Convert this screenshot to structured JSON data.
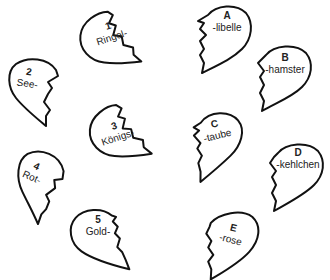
{
  "worksheet": {
    "left_pieces": [
      {
        "number": "1",
        "word": "Ringel-"
      },
      {
        "number": "2",
        "word": "See-"
      },
      {
        "number": "3",
        "word": "Königs-"
      },
      {
        "number": "4",
        "word": "Rot-"
      },
      {
        "number": "5",
        "word": "Gold-"
      }
    ],
    "right_pieces": [
      {
        "letter": "A",
        "word": "-libelle"
      },
      {
        "letter": "B",
        "word": "-hamster"
      },
      {
        "letter": "C",
        "word": "-taube"
      },
      {
        "letter": "D",
        "word": "-kehlchen"
      },
      {
        "letter": "E",
        "word": "-rose"
      }
    ],
    "colors": {
      "outline": "#111111",
      "fill": "#ffffff",
      "text": "#222222"
    }
  }
}
